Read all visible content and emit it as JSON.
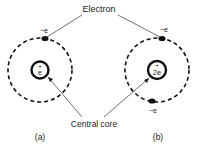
{
  "labels": {
    "electron": "Electron",
    "central_core": "Central core",
    "panel_a": "(a)",
    "panel_b": "(b)"
  },
  "atom_a": {
    "nucleus_sign": "+",
    "nucleus_charge": "e",
    "electron_charge": "−e"
  },
  "atom_b": {
    "nucleus_sign": "+",
    "nucleus_charge": "2e",
    "electron_top_charge": "−e",
    "electron_bottom_charge": "−e"
  },
  "colors": {
    "stroke": "#111111",
    "text": "#222222",
    "background": "#ffffff"
  }
}
